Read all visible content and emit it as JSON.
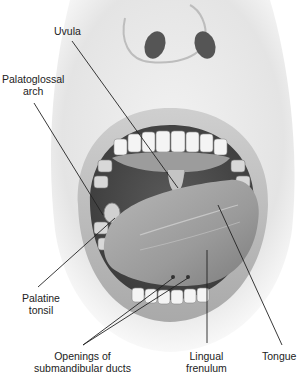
{
  "figure": {
    "labels": {
      "uvula": "Uvula",
      "palatoglossal_arch": [
        "Palatoglossal",
        "arch"
      ],
      "palatine_tonsil": [
        "Palatine",
        "tonsil"
      ],
      "openings_submandibular": [
        "Openings of",
        "submandibular ducts"
      ],
      "lingual_frenulum": [
        "Lingual",
        "frenulum"
      ],
      "tongue": "Tongue"
    }
  }
}
